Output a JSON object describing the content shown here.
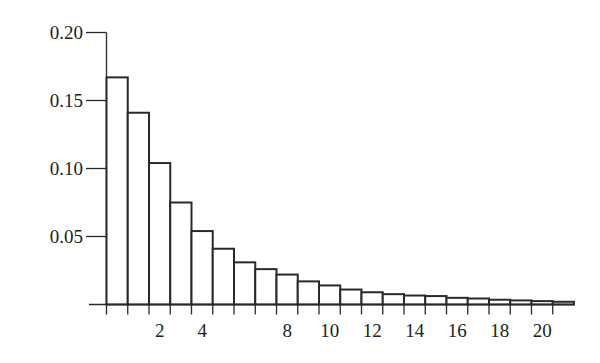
{
  "chart_data": {
    "type": "bar",
    "title": "",
    "xlabel": "",
    "ylabel": "",
    "x": [
      0,
      1,
      2,
      3,
      4,
      5,
      6,
      7,
      8,
      9,
      10,
      11,
      12,
      13,
      14,
      15,
      16,
      17,
      18,
      19,
      20,
      21
    ],
    "values": [
      0.167,
      0.141,
      0.104,
      0.075,
      0.054,
      0.041,
      0.031,
      0.026,
      0.022,
      0.017,
      0.014,
      0.011,
      0.009,
      0.0076,
      0.0066,
      0.0062,
      0.0049,
      0.0044,
      0.0035,
      0.003,
      0.0025,
      0.002
    ],
    "ylim": [
      0,
      0.2
    ],
    "yticks": [
      0.05,
      0.1,
      0.15,
      0.2
    ],
    "ytick_labels": [
      "0.05",
      "0.10",
      "0.15",
      "0.20"
    ],
    "xtick_labels": [
      {
        "x": 2,
        "label": "2"
      },
      {
        "x": 4,
        "label": "4"
      },
      {
        "x": 8,
        "label": "8"
      },
      {
        "x": 10,
        "label": "10"
      },
      {
        "x": 12,
        "label": "12"
      },
      {
        "x": 14,
        "label": "14"
      },
      {
        "x": 16,
        "label": "16"
      },
      {
        "x": 18,
        "label": "18"
      },
      {
        "x": 20,
        "label": "20"
      }
    ],
    "grid": false,
    "legend": null,
    "bar_style": {
      "fill": "#ffffff",
      "stroke": "#2a2a2a"
    }
  }
}
